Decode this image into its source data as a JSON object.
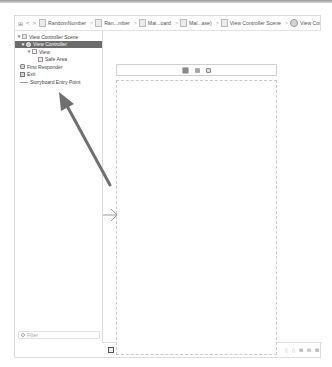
{
  "jumpbar": {
    "icons": [
      "grid-icon",
      "back-icon",
      "forward-icon"
    ],
    "back_glyph": "<",
    "forward_glyph": ">",
    "crumbs": [
      {
        "label": "RandomNumber",
        "icon": "folder-icon"
      },
      {
        "label": "Ran...mber",
        "icon": "folder-icon"
      },
      {
        "label": "Mai...oard",
        "icon": "storyboard-icon"
      },
      {
        "label": "Mai...ase)",
        "icon": "storyboard-icon"
      },
      {
        "label": "View Controller Scene",
        "icon": "scene-icon"
      },
      {
        "label": "View Controller",
        "icon": "view-controller-icon"
      }
    ],
    "separator": ">"
  },
  "outline": {
    "items": [
      {
        "label": "View Controller Scene",
        "level": 0,
        "icon": "scene",
        "disclosure": "▼",
        "selected": false
      },
      {
        "label": "View Controller",
        "level": 1,
        "icon": "vc",
        "disclosure": "▼",
        "selected": true
      },
      {
        "label": "View",
        "level": 2,
        "icon": "view",
        "disclosure": "▼",
        "selected": false
      },
      {
        "label": "Safe Area",
        "level": 3,
        "icon": "safe",
        "disclosure": "",
        "selected": false
      },
      {
        "label": "First Responder",
        "level": 1,
        "icon": "fr",
        "disclosure": "",
        "selected": false
      },
      {
        "label": "Exit",
        "level": 1,
        "icon": "exit",
        "disclosure": "",
        "selected": false
      },
      {
        "label": "Storyboard Entry Point",
        "level": 1,
        "icon": "line",
        "disclosure": "",
        "selected": false
      }
    ],
    "filter_placeholder": "Filter"
  },
  "canvas": {
    "scene_dock_icons": [
      "view-controller-icon",
      "first-responder-icon",
      "exit-icon"
    ]
  },
  "bottombar": {
    "view_as": "View as: iPhone 8 (←C →R)",
    "zoom_out": "—",
    "zoom_level": "120%",
    "zoom_in": "+",
    "right_controls": [
      "▯",
      "▯",
      "⊞",
      "⊟",
      "⊠"
    ]
  },
  "annotation": {
    "color": "#6f6f6f"
  }
}
